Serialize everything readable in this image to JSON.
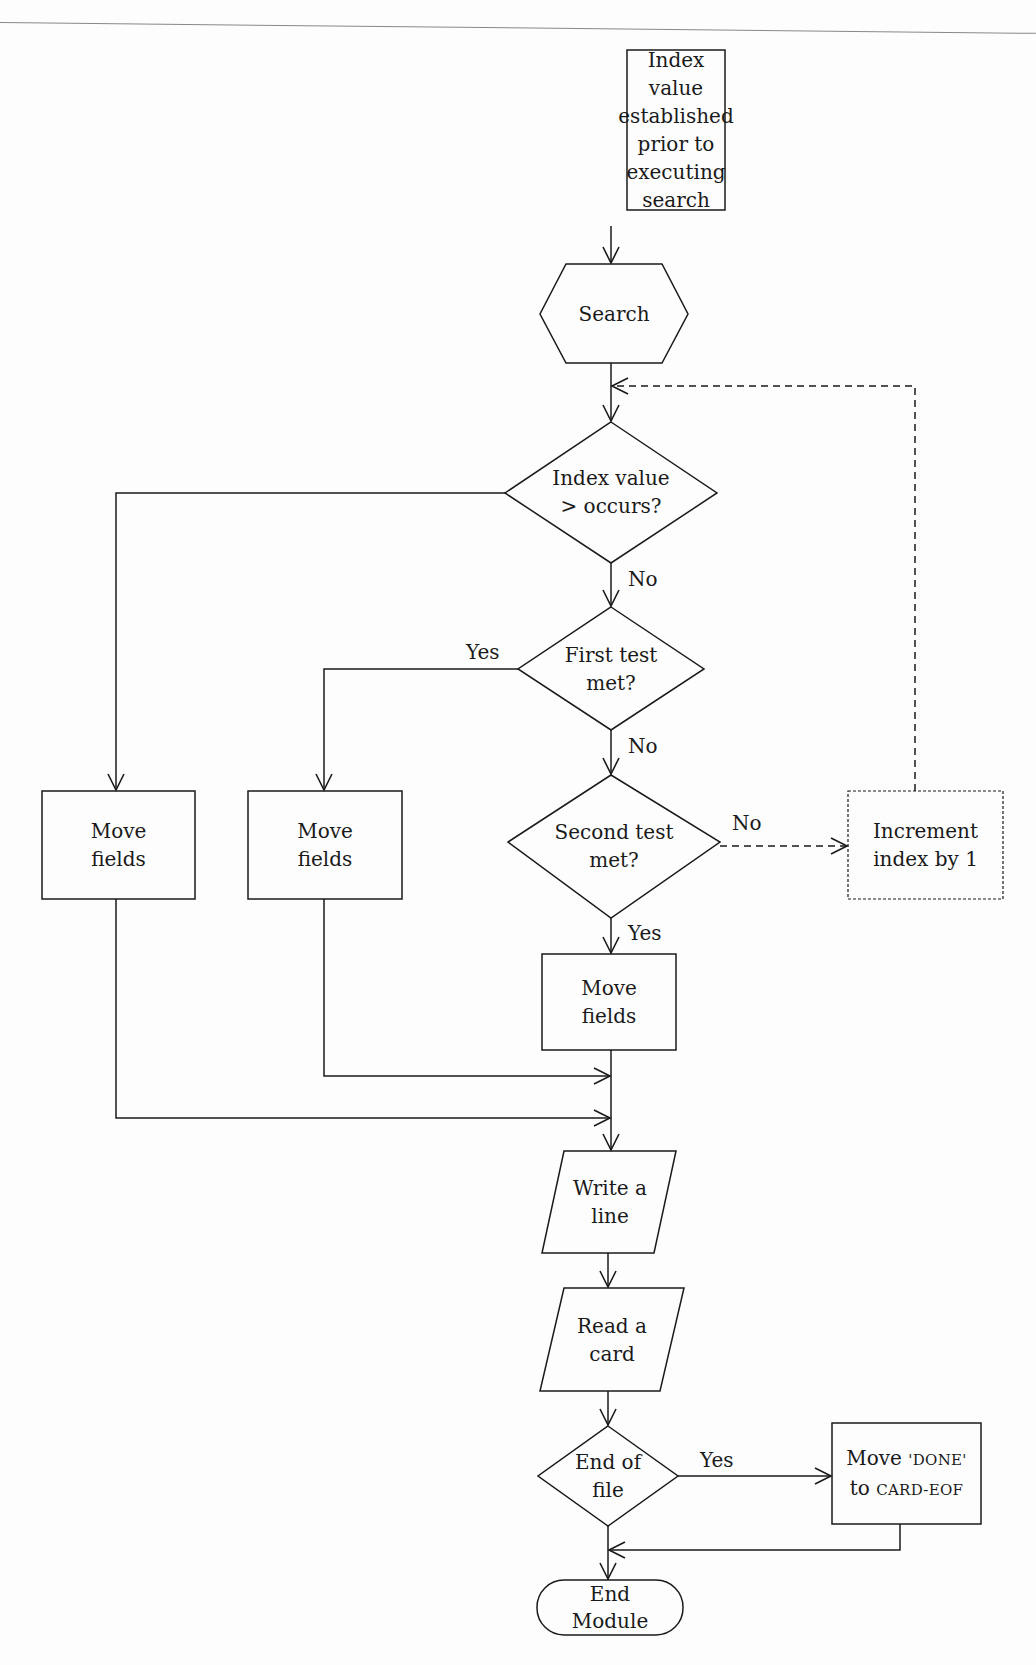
{
  "diagram": {
    "type": "flowchart",
    "nodes": {
      "init": {
        "shape": "process",
        "lines": [
          "Index value",
          "established",
          "prior to",
          "executing",
          "search"
        ]
      },
      "search": {
        "shape": "preparation",
        "lines": [
          "Search"
        ]
      },
      "occurs": {
        "shape": "decision",
        "lines": [
          "Index value",
          "> occurs?"
        ]
      },
      "first_test": {
        "shape": "decision",
        "lines": [
          "First test",
          "met?"
        ]
      },
      "second_test": {
        "shape": "decision",
        "lines": [
          "Second test",
          "met?"
        ]
      },
      "increment": {
        "shape": "process-dashed",
        "lines": [
          "Increment",
          "index by 1"
        ]
      },
      "move_left": {
        "shape": "process",
        "lines": [
          "Move",
          "fields"
        ]
      },
      "move_mid": {
        "shape": "process",
        "lines": [
          "Move",
          "fields"
        ]
      },
      "move_right": {
        "shape": "process",
        "lines": [
          "Move",
          "fields"
        ]
      },
      "write": {
        "shape": "io",
        "lines": [
          "Write a",
          "line"
        ]
      },
      "read": {
        "shape": "io",
        "lines": [
          "Read a",
          "card"
        ]
      },
      "eof": {
        "shape": "decision",
        "lines": [
          "End of",
          "file"
        ]
      },
      "move_done": {
        "shape": "process",
        "line1_prefix": "Move ",
        "line1_sc": "'DONE'",
        "line2_prefix": "to ",
        "line2_sc": "CARD-EOF"
      },
      "end": {
        "shape": "terminator",
        "lines": [
          "End",
          "Module"
        ]
      }
    },
    "edge_labels": {
      "occurs_no": "No",
      "first_yes": "Yes",
      "first_no": "No",
      "second_no": "No",
      "second_yes": "Yes",
      "eof_yes": "Yes"
    },
    "edges": [
      {
        "from": "init",
        "to": "search"
      },
      {
        "from": "search",
        "to": "occurs"
      },
      {
        "from": "occurs",
        "to": "move_left",
        "label": ""
      },
      {
        "from": "occurs",
        "to": "first_test",
        "label": "No"
      },
      {
        "from": "first_test",
        "to": "move_mid",
        "label": "Yes"
      },
      {
        "from": "first_test",
        "to": "second_test",
        "label": "No"
      },
      {
        "from": "second_test",
        "to": "increment",
        "label": "No",
        "style": "dashed"
      },
      {
        "from": "increment",
        "to": "occurs",
        "style": "dashed"
      },
      {
        "from": "second_test",
        "to": "move_right",
        "label": "Yes"
      },
      {
        "from": "move_left",
        "to": "write"
      },
      {
        "from": "move_mid",
        "to": "write"
      },
      {
        "from": "move_right",
        "to": "write"
      },
      {
        "from": "write",
        "to": "read"
      },
      {
        "from": "read",
        "to": "eof"
      },
      {
        "from": "eof",
        "to": "move_done",
        "label": "Yes"
      },
      {
        "from": "eof",
        "to": "end"
      },
      {
        "from": "move_done",
        "to": "end"
      }
    ]
  }
}
